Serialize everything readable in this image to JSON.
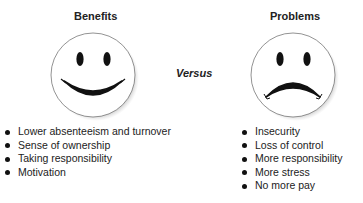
{
  "benefits": {
    "heading": "Benefits",
    "face": "smiley-face",
    "items": [
      "Lower absenteeism and turnover",
      "Sense of ownership",
      "Taking responsibility",
      "Motivation"
    ]
  },
  "versus_label": "Versus",
  "problems": {
    "heading": "Problems",
    "face": "sad-face",
    "items": [
      "Insecurity",
      "Loss of control",
      "More responsibility",
      "More stress",
      "No more pay"
    ]
  }
}
